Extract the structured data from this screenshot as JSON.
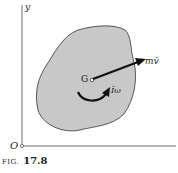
{
  "diagram": {
    "axes": {
      "y_label": "y",
      "origin_label": "O"
    },
    "body": {
      "fill": "#c8c8c8",
      "stroke": "#333333"
    },
    "center": {
      "label": "G"
    },
    "vectors": [
      {
        "label": "mv̄",
        "type": "linear-momentum"
      },
      {
        "label": "Īω",
        "type": "angular-momentum-couple"
      }
    ]
  },
  "caption": {
    "prefix": "FIG.",
    "number": "17.8"
  }
}
